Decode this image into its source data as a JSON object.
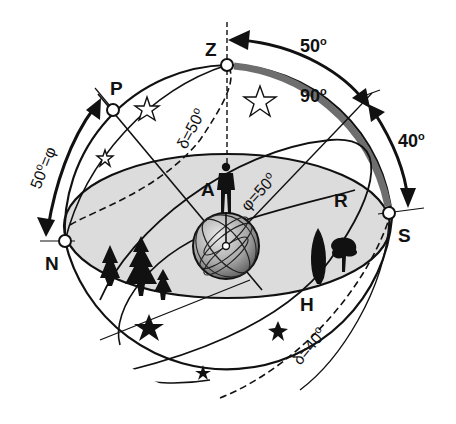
{
  "diagram": {
    "colors": {
      "line": "#111111",
      "horizon_fill": "#dcdcdc",
      "highlight_arc": "#6e6e6e",
      "globe_light": "#e6e6e6",
      "globe_dark": "#6a6a6a",
      "background": "#ffffff"
    },
    "points": {
      "zenith": "Z",
      "pole": "P",
      "north": "N",
      "south": "S",
      "observer": "A",
      "horizon": "H",
      "equator": "R"
    },
    "angles": {
      "zenith_to_equator": "50",
      "zenith_to_south": "90",
      "equator_to_south": "40",
      "latitude_arc": "50",
      "latitude_symbol": "φ",
      "latitude_eq": "φ=50",
      "declination_top": "δ=50",
      "declination_bottom": "δ=40",
      "degree": "o"
    },
    "icons": [
      "observer-figure-icon",
      "earth-globe-icon",
      "pine-trees-icon",
      "cypress-tree-icon",
      "broadleaf-tree-icon",
      "outline-star-icon",
      "filled-star-icon"
    ]
  }
}
